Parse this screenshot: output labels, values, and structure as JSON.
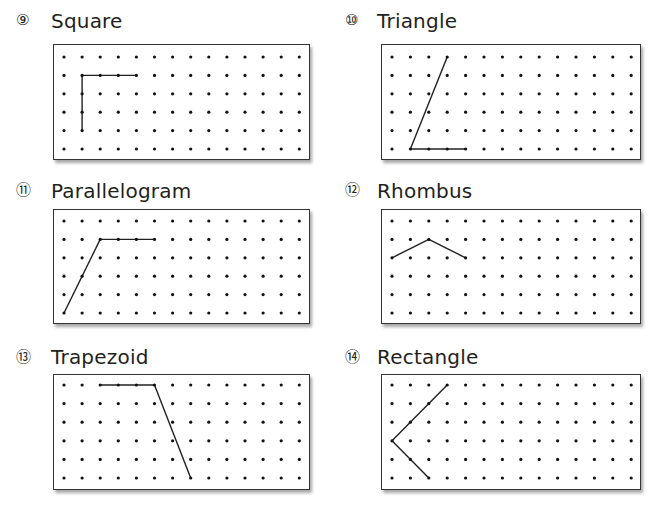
{
  "grid": {
    "columns": 14,
    "rows": 6,
    "dot_color": "#111111",
    "line_color": "#231f20"
  },
  "panels": [
    {
      "number": "⑨",
      "label": "Square",
      "segments": [
        [
          [
            1,
            4
          ],
          [
            1,
            1
          ]
        ],
        [
          [
            1,
            1
          ],
          [
            4,
            1
          ]
        ]
      ]
    },
    {
      "number": "⑩",
      "label": "Triangle",
      "segments": [
        [
          [
            3,
            0
          ],
          [
            1,
            5
          ]
        ],
        [
          [
            1,
            5
          ],
          [
            4,
            5
          ]
        ]
      ]
    },
    {
      "number": "⑪",
      "label": "Parallelogram",
      "segments": [
        [
          [
            0,
            5
          ],
          [
            2,
            1
          ]
        ],
        [
          [
            2,
            1
          ],
          [
            5,
            1
          ]
        ]
      ]
    },
    {
      "number": "⑫",
      "label": "Rhombus",
      "segments": [
        [
          [
            0,
            2
          ],
          [
            2,
            1
          ]
        ],
        [
          [
            2,
            1
          ],
          [
            4,
            2
          ]
        ]
      ]
    },
    {
      "number": "⑬",
      "label": "Trapezoid",
      "segments": [
        [
          [
            2,
            0
          ],
          [
            5,
            0
          ]
        ],
        [
          [
            5,
            0
          ],
          [
            7,
            5
          ]
        ]
      ]
    },
    {
      "number": "⑭",
      "label": "Rectangle",
      "segments": [
        [
          [
            3,
            0
          ],
          [
            0,
            3
          ]
        ],
        [
          [
            0,
            3
          ],
          [
            2,
            5
          ]
        ]
      ]
    }
  ]
}
